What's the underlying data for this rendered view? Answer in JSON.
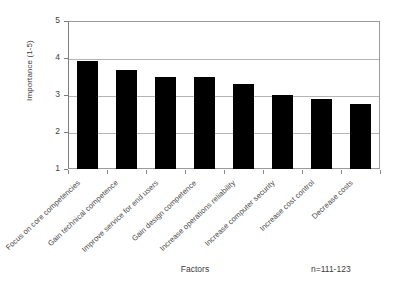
{
  "chart_data": {
    "type": "bar",
    "title": "",
    "xlabel": "Factors",
    "ylabel": "Importance (1-5)",
    "ylim": [
      1,
      5
    ],
    "yticks": [
      1,
      2,
      3,
      4,
      5
    ],
    "ytick_labels": [
      "1",
      "2",
      "3",
      "4",
      "5"
    ],
    "grid": true,
    "legend": false,
    "annotation": "n=111-123",
    "bar_color": "#000000",
    "categories": [
      "Focus on core competencies",
      "Gain technical competence",
      "Improve service for end users",
      "Gain design competence",
      "Increase operations reliability",
      "Increase computer security",
      "Increase cost control",
      "Decrease costs"
    ],
    "values": [
      3.93,
      3.68,
      3.5,
      3.48,
      3.3,
      3.0,
      2.9,
      2.75
    ]
  }
}
